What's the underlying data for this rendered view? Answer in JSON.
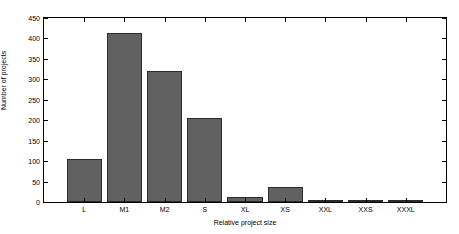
{
  "chart_data": {
    "type": "bar",
    "title": "",
    "subtitle": "",
    "xlabel": "Relative project size",
    "ylabel": "Number of projects",
    "categories": [
      "L",
      "M1",
      "M2",
      "S",
      "XL",
      "XS",
      "XXL",
      "XXS",
      "XXXL"
    ],
    "values": [
      105,
      413,
      320,
      205,
      13,
      37,
      3,
      3,
      1
    ],
    "series": [
      {
        "name": "Number of projects",
        "values": [
          105,
          413,
          320,
          205,
          13,
          37,
          3,
          3,
          1
        ]
      }
    ],
    "ylim": [
      0,
      450
    ],
    "xlim": [
      0,
      10
    ],
    "ytick_labels": [
      "0",
      "50",
      "100",
      "150",
      "200",
      "250",
      "300",
      "350",
      "400",
      "450"
    ],
    "ytick_values": [
      0,
      50,
      100,
      150,
      200,
      250,
      300,
      350,
      400,
      450
    ],
    "xtick_labels": [
      "L",
      "M1",
      "M2",
      "S",
      "XL",
      "XS",
      "XXL",
      "XXS",
      "XXXL"
    ],
    "xtick_values": [
      1,
      2,
      3,
      4,
      5,
      6,
      7,
      8,
      9
    ],
    "grid": false,
    "legend": null,
    "legend_position": "none",
    "bar_color": "#616161",
    "bar_edge_color": "#2b2b2b",
    "axis_color": "#000000",
    "background_color": "#ffffff",
    "bar_width_fraction": 0.88,
    "annotations": []
  }
}
